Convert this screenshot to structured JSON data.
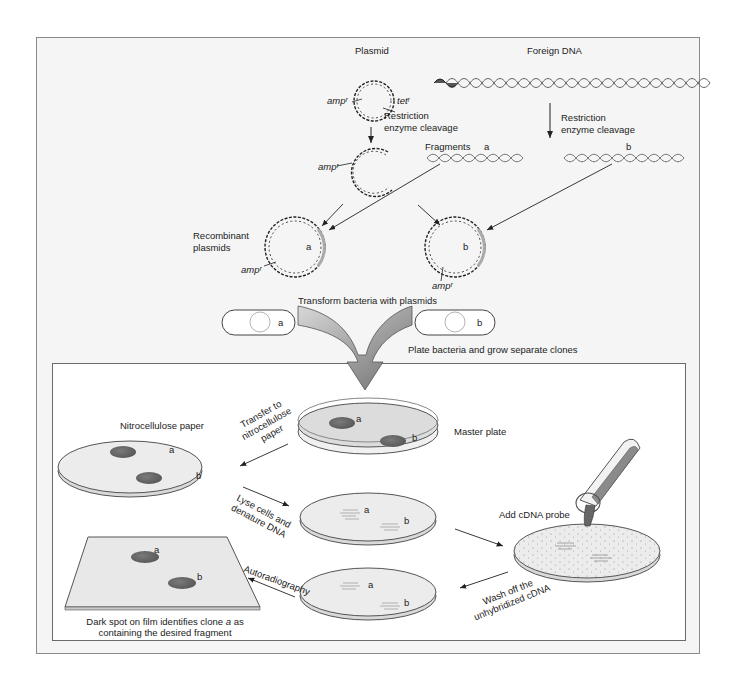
{
  "top": {
    "plasmid_label": "Plasmid",
    "foreign_dna_label": "Foreign DNA",
    "amp_label": "ampʳ",
    "tet_label": "tetʳ",
    "cleavage_left_1": "Restriction",
    "cleavage_left_2": "enzyme cleavage",
    "cleavage_right_1": "Restriction",
    "cleavage_right_2": "enzyme cleavage",
    "fragments_label": "Fragments",
    "fragment_a": "a",
    "fragment_b": "b",
    "cut_amp_label": "ampʳ",
    "recombinant_1": "Recombinant",
    "recombinant_2": "plasmids",
    "recomb_a": "a",
    "recomb_b": "b",
    "recomb_amp_a": "ampʳ",
    "recomb_amp_b": "ampʳ",
    "transform_label": "Transform bacteria with plasmids",
    "bacterium_a": "a",
    "bacterium_b": "b",
    "plate_label": "Plate bacteria and grow separate clones"
  },
  "bottom": {
    "nitrocellulose_label": "Nitrocellulose paper",
    "nitro_a": "a",
    "nitro_b": "b",
    "transfer_1": "Transfer to",
    "transfer_2": "nitrocellulose",
    "transfer_3": "paper",
    "master_plate_label": "Master plate",
    "master_a": "a",
    "master_b": "b",
    "lyse_1": "Lyse cells and",
    "lyse_2": "denature DNA",
    "lysed_a": "a",
    "lysed_b": "b",
    "probe_label": "Add cDNA probe",
    "wash_1": "Wash off the",
    "wash_2": "unhybridized cDNA",
    "washed_a": "a",
    "washed_b": "b",
    "autorad_label": "Autoradiography",
    "film_a": "a",
    "film_b": "b",
    "caption_1": "Dark spot on film identifies clone",
    "caption_italic": "a",
    "caption_1_end": "as",
    "caption_2": "containing the desired fragment"
  },
  "colors": {
    "frame_bg": "#f5f5f5",
    "spot": "#6b6b6b",
    "plate_fill": "#e4e4e4",
    "arrow_big": "#8c8c8c"
  }
}
